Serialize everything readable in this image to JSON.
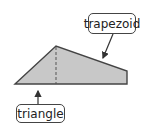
{
  "diagram": {
    "title": "",
    "labels": {
      "trapezoid": "trapezoid",
      "triangle": "triangle"
    },
    "shape": {
      "fill": "#c8c8c8",
      "stroke": "#444444",
      "vertices": [
        [
          15,
          84
        ],
        [
          56,
          46
        ],
        [
          127,
          71
        ],
        [
          127,
          84
        ]
      ],
      "divider": {
        "x": 56,
        "y1": 46,
        "y2": 84,
        "style": "dashed"
      }
    },
    "arrows": [
      {
        "from": "trapezoid",
        "to_point": [
          102,
          60
        ]
      },
      {
        "from": "triangle",
        "to_point": [
          38,
          89
        ]
      }
    ]
  }
}
